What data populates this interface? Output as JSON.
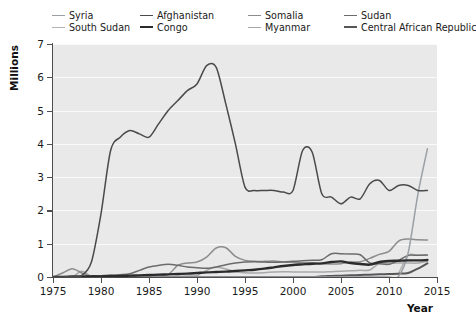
{
  "legend": {
    "position": "top",
    "items": [
      {
        "label": "Syria",
        "color": "#9aa0a6",
        "width": 1.5
      },
      {
        "label": "Afghanistan",
        "color": "#4a4a4a",
        "width": 1.5
      },
      {
        "label": "Somalia",
        "color": "#8c8c8c",
        "width": 1.5
      },
      {
        "label": "Sudan",
        "color": "#6b6b6b",
        "width": 1.5
      },
      {
        "label": "South Sudan",
        "color": "#b3b3b3",
        "width": 1.5
      },
      {
        "label": "Congo",
        "color": "#2b2b2b",
        "width": 2.4
      },
      {
        "label": "Myanmar",
        "color": "#a8a8a8",
        "width": 1.5
      },
      {
        "label": "Central African Republic",
        "color": "#575757",
        "width": 2.0
      }
    ]
  },
  "axes": {
    "y_title": "Millions",
    "x_title": "Year",
    "y_ticks": [
      "0",
      "1",
      "2",
      "3",
      "4",
      "5",
      "6",
      "7"
    ],
    "x_ticks": [
      "1975",
      "1980",
      "1985",
      "1990",
      "1995",
      "2000",
      "2005",
      "2010",
      "2015"
    ],
    "y_min": 0,
    "y_max": 7,
    "x_min": 1975,
    "x_max": 2015,
    "grid": true,
    "plot_bg": "#e9e9e9",
    "grid_color": "#fafafa",
    "axis_color": "#4d4d4d"
  },
  "chart_data": {
    "type": "line",
    "title": "",
    "xlabel": "Year",
    "ylabel": "Millions",
    "xlim": [
      1975,
      2015
    ],
    "ylim": [
      0,
      7
    ],
    "grid": true,
    "legend_position": "top",
    "x": [
      1975,
      1976,
      1977,
      1978,
      1979,
      1980,
      1981,
      1982,
      1983,
      1984,
      1985,
      1986,
      1987,
      1988,
      1989,
      1990,
      1991,
      1992,
      1993,
      1994,
      1995,
      1996,
      1997,
      1998,
      1999,
      2000,
      2001,
      2002,
      2003,
      2004,
      2005,
      2006,
      2007,
      2008,
      2009,
      2010,
      2011,
      2012,
      2013,
      2014
    ],
    "series": [
      {
        "name": "Syria",
        "color": "#9aa0a6",
        "values": [
          0.0,
          0.0,
          0.0,
          0.0,
          0.0,
          0.0,
          0.0,
          0.0,
          0.0,
          0.0,
          0.0,
          0.0,
          0.0,
          0.0,
          0.0,
          0.0,
          0.0,
          0.0,
          0.0,
          0.0,
          0.0,
          0.0,
          0.0,
          0.0,
          0.0,
          0.0,
          0.0,
          0.0,
          0.0,
          0.0,
          0.0,
          0.0,
          0.0,
          0.0,
          0.0,
          0.0,
          0.02,
          0.73,
          2.47,
          3.85
        ]
      },
      {
        "name": "Afghanistan",
        "color": "#4a4a4a",
        "values": [
          0.0,
          0.0,
          0.02,
          0.05,
          0.45,
          1.9,
          3.8,
          4.2,
          4.4,
          4.3,
          4.2,
          4.6,
          5.0,
          5.3,
          5.6,
          5.8,
          6.35,
          6.3,
          5.2,
          4.0,
          2.7,
          2.6,
          2.6,
          2.6,
          2.55,
          2.6,
          3.8,
          3.75,
          2.5,
          2.4,
          2.2,
          2.4,
          2.35,
          2.8,
          2.9,
          2.6,
          2.75,
          2.75,
          2.6,
          2.6
        ]
      },
      {
        "name": "Somalia",
        "color": "#8c8c8c",
        "values": [
          0.0,
          0.12,
          0.25,
          0.12,
          0.02,
          0.0,
          0.01,
          0.02,
          0.03,
          0.04,
          0.05,
          0.06,
          0.07,
          0.35,
          0.42,
          0.45,
          0.6,
          0.87,
          0.88,
          0.62,
          0.5,
          0.47,
          0.47,
          0.48,
          0.45,
          0.44,
          0.43,
          0.43,
          0.4,
          0.39,
          0.4,
          0.45,
          0.46,
          0.56,
          0.68,
          0.77,
          1.08,
          1.14,
          1.12,
          1.11
        ]
      },
      {
        "name": "Sudan",
        "color": "#6b6b6b",
        "values": [
          0.0,
          0.01,
          0.02,
          0.02,
          0.03,
          0.04,
          0.05,
          0.07,
          0.1,
          0.2,
          0.3,
          0.35,
          0.38,
          0.35,
          0.3,
          0.28,
          0.26,
          0.3,
          0.37,
          0.42,
          0.45,
          0.46,
          0.45,
          0.44,
          0.45,
          0.47,
          0.49,
          0.5,
          0.52,
          0.7,
          0.7,
          0.69,
          0.67,
          0.42,
          0.4,
          0.38,
          0.5,
          0.65,
          0.65,
          0.66
        ]
      },
      {
        "name": "South Sudan",
        "color": "#b3b3b3",
        "values": [
          null,
          null,
          null,
          null,
          null,
          null,
          null,
          null,
          null,
          null,
          null,
          null,
          null,
          null,
          null,
          null,
          null,
          null,
          null,
          null,
          null,
          null,
          null,
          null,
          null,
          null,
          null,
          null,
          null,
          null,
          null,
          null,
          null,
          null,
          null,
          null,
          0.1,
          0.65,
          0.65,
          0.65
        ]
      },
      {
        "name": "Congo",
        "color": "#2b2b2b",
        "values": [
          0.0,
          0.0,
          0.01,
          0.01,
          0.02,
          0.02,
          0.03,
          0.03,
          0.04,
          0.05,
          0.06,
          0.07,
          0.08,
          0.09,
          0.1,
          0.12,
          0.14,
          0.15,
          0.16,
          0.18,
          0.2,
          0.22,
          0.25,
          0.29,
          0.33,
          0.36,
          0.38,
          0.4,
          0.41,
          0.45,
          0.47,
          0.42,
          0.39,
          0.37,
          0.45,
          0.48,
          0.49,
          0.5,
          0.5,
          0.51
        ]
      },
      {
        "name": "Myanmar",
        "color": "#a8a8a8",
        "values": [
          0.0,
          0.0,
          0.0,
          0.17,
          0.02,
          0.0,
          0.0,
          0.0,
          0.0,
          0.0,
          0.0,
          0.0,
          0.01,
          0.02,
          0.03,
          0.04,
          0.2,
          0.29,
          0.24,
          0.16,
          0.13,
          0.12,
          0.13,
          0.15,
          0.16,
          0.15,
          0.15,
          0.15,
          0.15,
          0.16,
          0.17,
          0.19,
          0.2,
          0.21,
          0.41,
          0.42,
          0.42,
          0.42,
          0.42,
          0.48
        ]
      },
      {
        "name": "Central African Republic",
        "color": "#575757",
        "values": [
          0.0,
          0.0,
          0.0,
          0.0,
          0.0,
          0.0,
          0.0,
          0.0,
          0.0,
          0.0,
          0.0,
          0.0,
          0.0,
          0.0,
          0.0,
          0.0,
          0.0,
          0.0,
          0.0,
          0.0,
          0.0,
          0.0,
          0.0,
          0.0,
          0.0,
          0.0,
          0.0,
          0.0,
          0.02,
          0.03,
          0.04,
          0.05,
          0.06,
          0.07,
          0.08,
          0.09,
          0.1,
          0.12,
          0.25,
          0.41
        ]
      }
    ]
  }
}
